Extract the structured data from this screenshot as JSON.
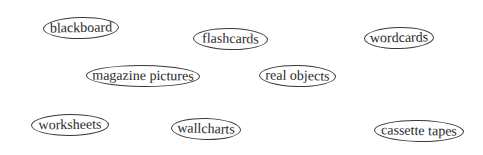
{
  "labels": [
    {
      "id": "blackboard",
      "text": "blackboard"
    },
    {
      "id": "flashcards",
      "text": "flashcards"
    },
    {
      "id": "wordcards",
      "text": "wordcards"
    },
    {
      "id": "magazine-pictures",
      "text": "magazine pictures"
    },
    {
      "id": "real-objects",
      "text": "real objects"
    },
    {
      "id": "worksheets",
      "text": "worksheets"
    },
    {
      "id": "wallcharts",
      "text": "wallcharts"
    },
    {
      "id": "cassette-tapes",
      "text": "cassette tapes"
    }
  ]
}
